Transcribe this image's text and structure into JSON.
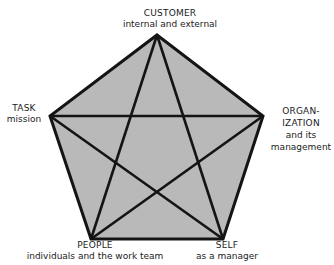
{
  "diagram": {
    "shape": "pentagon-with-inscribed-star",
    "colors": {
      "fill": "#b9b9b9",
      "stroke": "#141414",
      "background": "#ffffff"
    },
    "vertices": {
      "customer": {
        "x": 157,
        "y": 35
      },
      "organization": {
        "x": 263,
        "y": 116
      },
      "self": {
        "x": 223,
        "y": 239
      },
      "people": {
        "x": 91,
        "y": 239
      },
      "task": {
        "x": 50,
        "y": 116
      }
    },
    "nodes": [
      {
        "id": "customer",
        "title": "CUSTOMER",
        "subtitle": "internal and external"
      },
      {
        "id": "organization",
        "title": "ORGAN-\nIZATION",
        "subtitle": "and its\nmanagement"
      },
      {
        "id": "self",
        "title": "SELF",
        "subtitle": "as a manager"
      },
      {
        "id": "people",
        "title": "PEOPLE",
        "subtitle": "individuals and the work team"
      },
      {
        "id": "task",
        "title": "TASK",
        "subtitle": "mission"
      }
    ],
    "labels": {
      "customer_title": "CUSTOMER",
      "customer_sub": "internal and external",
      "task_title": "TASK",
      "task_sub": "mission",
      "org_title_1": "ORGAN-",
      "org_title_2": "IZATION",
      "org_sub_1": "and its",
      "org_sub_2": "management",
      "people_title": "PEOPLE",
      "people_sub": "individuals and the work team",
      "self_title": "SELF",
      "self_sub": "as a manager"
    }
  }
}
